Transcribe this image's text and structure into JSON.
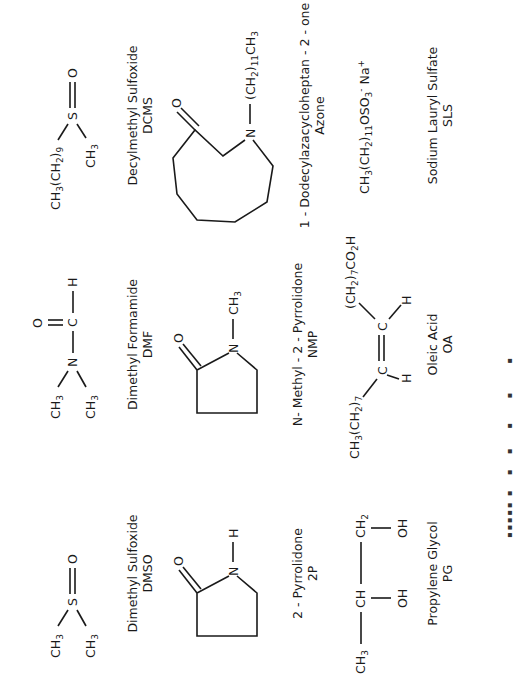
{
  "figure": {
    "rows": [
      [
        {
          "name": "Dimethyl Sulfoxide",
          "abbr": "DMSO",
          "labels": {
            "a": "CH",
            "a_sub": "3",
            "b": "CH",
            "b_sub": "3",
            "s": "S",
            "o": "O"
          }
        },
        {
          "name": "Dimethyl Formamide",
          "abbr": "DMF",
          "labels": {
            "a": "CH",
            "a_sub": "3",
            "b": "CH",
            "b_sub": "3",
            "n": "N",
            "c": "C",
            "h": "H",
            "o": "O"
          }
        },
        {
          "name": "Decylmethyl Sulfoxide",
          "abbr": "DCMS",
          "labels": {
            "a": "CH3(CH2)9",
            "b": "CH",
            "b_sub": "3",
            "s": "S",
            "o": "O"
          }
        }
      ],
      [
        {
          "name": "2 - Pyrrolidone",
          "abbr": "2P",
          "labels": {
            "n": "N",
            "h": "H",
            "o": "O"
          }
        },
        {
          "name": "N- Methyl - 2 - Pyrrolidone",
          "abbr": "NMP",
          "labels": {
            "n": "N",
            "sub": "CH3",
            "o": "O"
          }
        },
        {
          "name": "1 - Dodecylazacycloheptan - 2 - one",
          "abbr": "Azone",
          "labels": {
            "n": "N",
            "sub": "(CH2)11CH3",
            "o": "O"
          }
        }
      ],
      [
        {
          "name": "Propylene Glycol",
          "abbr": "PG",
          "labels": {
            "c1": "CH3",
            "c2": "CH",
            "c3": "CH2",
            "oh1": "OH",
            "oh2": "OH"
          }
        },
        {
          "name": "Oleic Acid",
          "abbr": "OA",
          "labels": {
            "left": "CH3(CH2)7",
            "right": "(CH2)7CO2H",
            "c": "C",
            "h": "H"
          }
        },
        {
          "name": "Sodium Lauryl Sulfate",
          "abbr": "SLS",
          "labels": {
            "formula": "CH3(CH2)11OSO3- Na+"
          }
        }
      ]
    ],
    "caption_visible": "partially cut off at page edge (illegible)"
  }
}
